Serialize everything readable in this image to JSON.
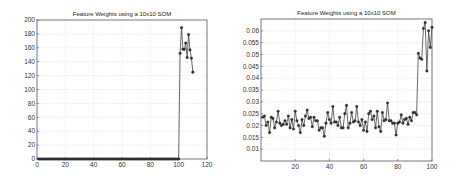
{
  "chart_data": [
    {
      "type": "line",
      "title": "Feature Weights using a 10x10 SOM",
      "xlabel": "",
      "ylabel": "",
      "xlim": [
        0,
        120
      ],
      "ylim": [
        0,
        200
      ],
      "xticks": [
        0,
        20,
        40,
        60,
        80,
        100,
        120
      ],
      "yticks": [
        0,
        20,
        40,
        60,
        80,
        100,
        120,
        140,
        160,
        180,
        200
      ],
      "grid": true,
      "marker": "*",
      "series": [
        {
          "name": "feature weights",
          "x": [
            1,
            2,
            3,
            4,
            5,
            6,
            7,
            8,
            9,
            10,
            11,
            12,
            13,
            14,
            15,
            16,
            17,
            18,
            19,
            20,
            21,
            22,
            23,
            24,
            25,
            26,
            27,
            28,
            29,
            30,
            31,
            32,
            33,
            34,
            35,
            36,
            37,
            38,
            39,
            40,
            41,
            42,
            43,
            44,
            45,
            46,
            47,
            48,
            49,
            50,
            51,
            52,
            53,
            54,
            55,
            56,
            57,
            58,
            59,
            60,
            61,
            62,
            63,
            64,
            65,
            66,
            67,
            68,
            69,
            70,
            71,
            72,
            73,
            74,
            75,
            76,
            77,
            78,
            79,
            80,
            81,
            82,
            83,
            84,
            85,
            86,
            87,
            88,
            89,
            90,
            91,
            92,
            93,
            94,
            95,
            96,
            97,
            98,
            99,
            100,
            101,
            102,
            103,
            104,
            105,
            106,
            107,
            108,
            109,
            110
          ],
          "values": [
            0,
            0,
            0,
            0,
            0,
            0,
            0,
            0,
            0,
            0,
            0,
            0,
            0,
            0,
            0,
            0,
            0,
            0,
            0,
            0,
            0,
            0,
            0,
            0,
            0,
            0,
            0,
            0,
            0,
            0,
            0,
            0,
            0,
            0,
            0,
            0,
            0,
            0,
            0,
            0,
            0,
            0,
            0,
            0,
            0,
            0,
            0,
            0,
            0,
            0,
            0,
            0,
            0,
            0,
            0,
            0,
            0,
            0,
            0,
            0,
            0,
            0,
            0,
            0,
            0,
            0,
            0,
            0,
            0,
            0,
            0,
            0,
            0,
            0,
            0,
            0,
            0,
            0,
            0,
            0,
            0,
            0,
            0,
            0,
            0,
            0,
            0,
            0,
            0,
            0,
            0,
            0,
            0,
            0,
            0,
            0,
            0,
            0,
            0,
            0,
            152,
            189,
            158,
            158,
            167,
            146,
            179,
            157,
            145,
            125
          ]
        }
      ]
    },
    {
      "type": "line",
      "title": "Feature Weights using a 10x10 SOM",
      "xlabel": "",
      "ylabel": "",
      "xlim": [
        0,
        100
      ],
      "ylim": [
        0.005,
        0.065
      ],
      "xticks": [
        20,
        40,
        60,
        80,
        100
      ],
      "yticks": [
        0.01,
        0.015,
        0.02,
        0.025,
        0.03,
        0.035,
        0.04,
        0.045,
        0.05,
        0.055,
        0.06
      ],
      "grid": true,
      "marker": "*",
      "series": [
        {
          "name": "feature weights",
          "x": [
            1,
            2,
            3,
            4,
            5,
            6,
            7,
            8,
            9,
            10,
            11,
            12,
            13,
            14,
            15,
            16,
            17,
            18,
            19,
            20,
            21,
            22,
            23,
            24,
            25,
            26,
            27,
            28,
            29,
            30,
            31,
            32,
            33,
            34,
            35,
            36,
            37,
            38,
            39,
            40,
            41,
            42,
            43,
            44,
            45,
            46,
            47,
            48,
            49,
            50,
            51,
            52,
            53,
            54,
            55,
            56,
            57,
            58,
            59,
            60,
            61,
            62,
            63,
            64,
            65,
            66,
            67,
            68,
            69,
            70,
            71,
            72,
            73,
            74,
            75,
            76,
            77,
            78,
            79,
            80,
            81,
            82,
            83,
            84,
            85,
            86,
            87,
            88,
            89,
            90,
            91,
            92,
            93,
            94,
            95,
            96,
            97,
            98,
            99,
            100
          ],
          "values": [
            0.0235,
            0.024,
            0.02,
            0.0215,
            0.017,
            0.0235,
            0.023,
            0.019,
            0.0215,
            0.026,
            0.021,
            0.02,
            0.0205,
            0.022,
            0.0205,
            0.024,
            0.019,
            0.0225,
            0.0185,
            0.026,
            0.022,
            0.02,
            0.017,
            0.0225,
            0.02,
            0.024,
            0.0265,
            0.023,
            0.0235,
            0.0195,
            0.0235,
            0.022,
            0.022,
            0.018,
            0.019,
            0.019,
            0.0155,
            0.021,
            0.0255,
            0.0225,
            0.021,
            0.028,
            0.0215,
            0.0215,
            0.02,
            0.0235,
            0.019,
            0.019,
            0.025,
            0.0285,
            0.019,
            0.021,
            0.0255,
            0.0215,
            0.022,
            0.028,
            0.0215,
            0.02,
            0.0225,
            0.018,
            0.0215,
            0.0175,
            0.025,
            0.026,
            0.0225,
            0.024,
            0.019,
            0.026,
            0.0195,
            0.0175,
            0.0255,
            0.022,
            0.0225,
            0.0295,
            0.022,
            0.022,
            0.021,
            0.021,
            0.016,
            0.021,
            0.0215,
            0.0245,
            0.021,
            0.0225,
            0.023,
            0.0205,
            0.0235,
            0.022,
            0.0255,
            0.0255,
            0.0245,
            0.0505,
            0.0485,
            0.048,
            0.061,
            0.0635,
            0.043,
            0.06,
            0.053,
            0.0615,
            0.0605
          ]
        }
      ]
    }
  ]
}
